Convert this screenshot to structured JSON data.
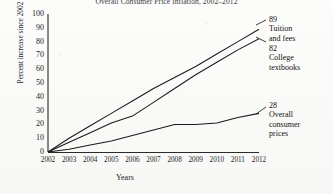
{
  "chart_data": {
    "type": "line",
    "title": "Overall Consumer Price Inflation, 2002–2012",
    "xlabel": "Years",
    "ylabel": "Percent increase since 2002",
    "x": [
      2002,
      2003,
      2004,
      2005,
      2006,
      2007,
      2008,
      2009,
      2010,
      2011,
      2012
    ],
    "xtick_labels": [
      "2002",
      "2003",
      "2004",
      "2005",
      "2006",
      "2007",
      "2008",
      "2009",
      "2010",
      "2011",
      "2012"
    ],
    "ytick_labels": [
      "100",
      "90",
      "80",
      "70",
      "60",
      "50",
      "40",
      "30",
      "20",
      "10",
      "0"
    ],
    "yticks": [
      100,
      90,
      80,
      70,
      60,
      50,
      40,
      30,
      20,
      10,
      0
    ],
    "xlim": [
      2002,
      2012
    ],
    "ylim": [
      0,
      100
    ],
    "grid": false,
    "legend_position": "right-annotations",
    "line_color": "#1a1a1a",
    "series": [
      {
        "name": "Tuition and fees",
        "end_value": 89,
        "end_label": "89",
        "values": [
          0,
          10,
          19,
          28,
          37,
          46,
          54,
          62,
          71,
          80,
          89
        ]
      },
      {
        "name": "College textbooks",
        "end_value": 82,
        "end_label": "82",
        "values": [
          0,
          7,
          14,
          21,
          26,
          36,
          46,
          56,
          65,
          74,
          82
        ]
      },
      {
        "name": "Overall consumer prices",
        "end_value": 28,
        "end_label": "28",
        "values": [
          0,
          2,
          5,
          8,
          12,
          16,
          20,
          20,
          21,
          25,
          28
        ]
      }
    ],
    "annotations": [
      {
        "value": "89",
        "name_line1": "Tuition",
        "name_line2": "and fees"
      },
      {
        "value": "82",
        "name_line1": "College",
        "name_line2": "textbooks"
      },
      {
        "value": "28",
        "name_line1": "Overall",
        "name_line2": "consumer",
        "name_line3": "prices"
      }
    ]
  }
}
